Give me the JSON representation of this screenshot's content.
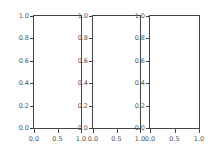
{
  "chart_data": [
    {
      "type": "line",
      "title": "",
      "xlabel": "",
      "ylabel": "",
      "series": [],
      "xlim": [
        0.0,
        1.0
      ],
      "ylim": [
        0.0,
        1.0
      ],
      "xticks": [
        "0.0",
        "0.5",
        "1.0"
      ],
      "yticks": [
        "0.0",
        "0.2",
        "0.4",
        "0.6",
        "0.8",
        "1.0"
      ],
      "grid": false
    },
    {
      "type": "line",
      "title": "",
      "xlabel": "",
      "ylabel": "",
      "series": [],
      "xlim": [
        0.0,
        1.0
      ],
      "ylim": [
        0.0,
        1.0
      ],
      "xticks": [
        "0.0",
        "0.5",
        "1.0"
      ],
      "yticks": [
        "0.0",
        "0.2",
        "0.4",
        "0.6",
        "0.8",
        "1.0"
      ],
      "grid": false
    },
    {
      "type": "line",
      "title": "",
      "xlabel": "",
      "ylabel": "",
      "series": [],
      "xlim": [
        0.0,
        1.0
      ],
      "ylim": [
        0.0,
        1.0
      ],
      "xticks": [
        "0.0",
        "0.5",
        "1.0"
      ],
      "yticks": [
        "0.0",
        "0.2",
        "0.4",
        "0.6",
        "0.8",
        "1.0"
      ],
      "grid": false
    }
  ],
  "axes": [
    {
      "left": 33,
      "width": 49
    },
    {
      "left": 92,
      "width": 49
    },
    {
      "left": 149,
      "width": 51
    }
  ],
  "colors": {
    "axis": "#444444",
    "tick_label": "#555555",
    "background": "#ffffff"
  }
}
